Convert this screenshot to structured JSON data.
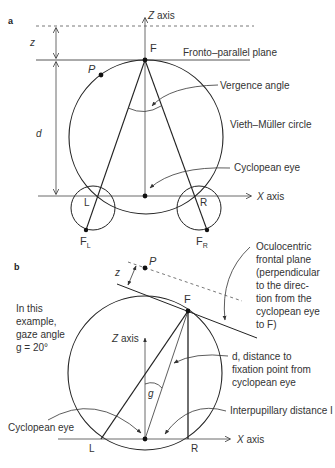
{
  "panel_a": {
    "tag": "a",
    "z_axis": "Z axis",
    "x_axis": "X axis",
    "z_label": "z",
    "d_label": "d",
    "F": "F",
    "P": "P",
    "L": "L",
    "R": "R",
    "FL": "F",
    "FL_sub": "L",
    "FR": "F",
    "FR_sub": "R",
    "fronto_parallel": "Fronto–parallel plane",
    "vergence": "Vergence angle",
    "vieth": "Vieth–Müller circle",
    "cyclopean": "Cyclopean eye"
  },
  "panel_b": {
    "tag": "b",
    "P": "P",
    "z_label": "z",
    "F": "F",
    "z_axis": "Z axis",
    "x_axis": "X axis",
    "g_label": "g",
    "L": "L",
    "R": "R",
    "example": [
      "In this",
      "example,",
      "gaze angle",
      "g = 20°"
    ],
    "oculocentric": [
      "Oculocentric",
      "frontal plane",
      "(perpendicular",
      "to the direc-",
      "tion from the",
      "cyclopean eye",
      "to F)"
    ],
    "distance": [
      "d, distance to",
      "fixation point from",
      "cyclopean eye"
    ],
    "interpupillary": "Interpupillary distance I",
    "cyclopean": "Cyclopean eye"
  }
}
